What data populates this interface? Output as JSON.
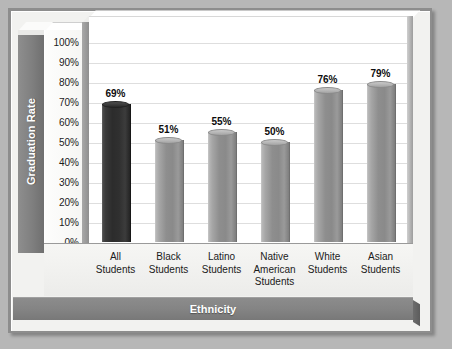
{
  "chart_data": {
    "type": "bar",
    "title": "",
    "subtitle": "",
    "xlabel": "Ethnicity",
    "ylabel": "Graduation Rate",
    "categories": [
      "All Students",
      "Black Students",
      "Latino Students",
      "Native American Students",
      "White Students",
      "Asian Students"
    ],
    "category_lines": [
      [
        "All",
        "Students"
      ],
      [
        "Black",
        "Students"
      ],
      [
        "Latino",
        "Students"
      ],
      [
        "Native",
        "American",
        "Students"
      ],
      [
        "White",
        "Students"
      ],
      [
        "Asian",
        "Students"
      ]
    ],
    "values": [
      69,
      51,
      55,
      50,
      76,
      79
    ],
    "value_labels": [
      "69%",
      "51%",
      "55%",
      "50%",
      "76%",
      "79%"
    ],
    "bar_styles": [
      "dark",
      "gray",
      "gray",
      "gray",
      "gray",
      "gray"
    ],
    "ylim": [
      0,
      100
    ],
    "ytick_values": [
      100,
      90,
      80,
      70,
      60,
      50,
      40,
      30,
      20,
      10,
      0
    ],
    "ytick_labels": [
      "100%",
      "90%",
      "80%",
      "70%",
      "60%",
      "50%",
      "40%",
      "30%",
      "20%",
      "10%",
      "0%"
    ],
    "grid": true,
    "grid_axis": "y",
    "legend": false,
    "legend_position": "none",
    "style_3d": true
  },
  "colors": {
    "background": "#b7b7b7",
    "plaque_border": "#8d8d8d",
    "panel": "#f2f2f0",
    "plot_area": "#ffffff",
    "gridline": "#dedede",
    "axis_band": "#848484",
    "axis_band_text": "#ffffff",
    "bar_gray": "#8e8e8e",
    "bar_dark": "#2c2c2c",
    "tick_text": "#1b1b1b",
    "value_text": "#0d0d0d"
  }
}
